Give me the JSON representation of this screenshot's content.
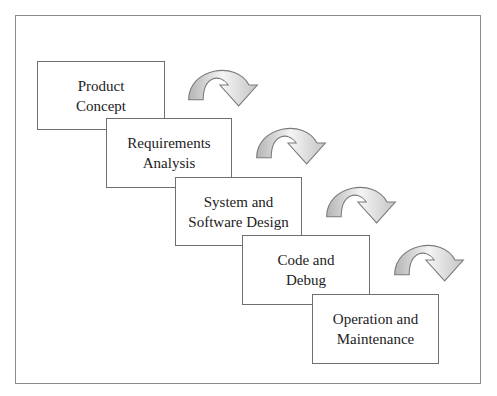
{
  "diagram": {
    "type": "waterfall-process",
    "stages": [
      {
        "line1": "Product",
        "line2": "Concept"
      },
      {
        "line1": "Requirements",
        "line2": "Analysis"
      },
      {
        "line1": "System and",
        "line2": "Software Design"
      },
      {
        "line1": "Code and",
        "line2": "Debug"
      },
      {
        "line1": "Operation and",
        "line2": "Maintenance"
      }
    ],
    "arrow_count": 4,
    "colors": {
      "box_border": "#6f6f6f",
      "arrow_fill_light": "#f4f4f4",
      "arrow_fill_dark": "#b5b5b5",
      "arrow_stroke": "#7a7a7a"
    }
  }
}
